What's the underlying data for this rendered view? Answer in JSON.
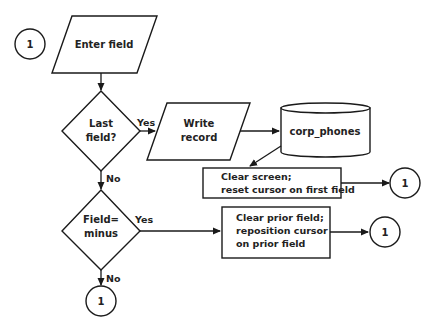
{
  "diagram": {
    "type": "flowchart",
    "nodes": {
      "connector_start": {
        "label": "1"
      },
      "enter_field": {
        "label": "Enter field"
      },
      "last_field": {
        "line1": "Last",
        "line2": "field?"
      },
      "write_record": {
        "line1": "Write",
        "line2": "record"
      },
      "corp_phones": {
        "label": "corp_phones"
      },
      "clear_screen": {
        "line1": "Clear screen;",
        "line2": "reset cursor on first field"
      },
      "connector_clear_screen": {
        "label": "1"
      },
      "field_minus": {
        "line1": "Field=",
        "line2": "minus"
      },
      "clear_prior": {
        "line1": "Clear prior field;",
        "line2": "reposition cursor",
        "line3": "on prior field"
      },
      "connector_clear_prior": {
        "label": "1"
      },
      "connector_end": {
        "label": "1"
      }
    },
    "edge_labels": {
      "last_field_yes": "Yes",
      "last_field_no": "No",
      "field_minus_yes": "Yes",
      "field_minus_no": "No"
    },
    "colors": {
      "stroke": "#1a1a1a",
      "fill": "#ffffff",
      "text": "#222222"
    }
  }
}
